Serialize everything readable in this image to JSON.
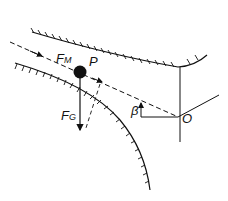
{
  "diagram": {
    "type": "force diagram",
    "labels": {
      "magnetic_force": {
        "main": "F",
        "sub": "M"
      },
      "gravity_force": {
        "main": "F",
        "sub": "G"
      },
      "particle": "P",
      "angle": "β",
      "center": "O"
    },
    "colors": {
      "ink": "#111111",
      "background": "#ffffff"
    }
  }
}
